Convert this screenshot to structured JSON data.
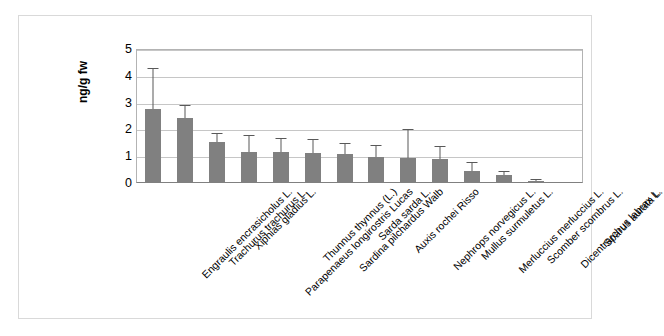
{
  "chart_data": {
    "type": "bar",
    "title": "",
    "xlabel": "",
    "ylabel": "ng/g fw",
    "ylim": [
      0,
      5
    ],
    "yticks": [
      0,
      1,
      2,
      3,
      4,
      5
    ],
    "grid": true,
    "legend": "none",
    "bar_color": "#808080",
    "error_bar_color": "#595959",
    "categories": [
      "Engraulis encrasicholus L.",
      "Trachurus trachurus L.",
      "Xiphias gladius L.",
      "Parapenaeus longirostris Lucas",
      "Thunnus thynnus (L.)",
      "Sardina pilchardus Walb",
      "Sarda sarda L.",
      "Auxis rochei Risso",
      "Nephrops norvegicus L.",
      "Mullus surmuletus L.",
      "Merluccius merluccius L.",
      "Scomber scombrus L.",
      "Dicentrarchus labrax L.",
      "Sparus aurata L."
    ],
    "values": [
      2.72,
      2.4,
      1.5,
      1.12,
      1.12,
      1.08,
      1.03,
      0.92,
      0.88,
      0.85,
      0.42,
      0.25,
      0.04,
      0.0
    ],
    "errors_upper": [
      4.2,
      2.85,
      1.78,
      1.7,
      1.6,
      1.55,
      1.42,
      1.35,
      1.95,
      1.3,
      0.72,
      0.38,
      0.07,
      0.0
    ]
  }
}
